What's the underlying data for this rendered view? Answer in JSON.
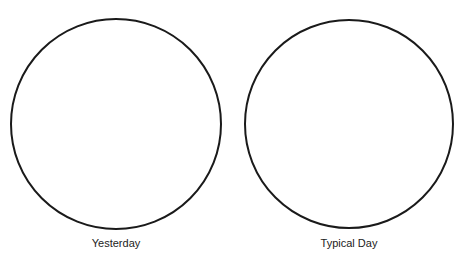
{
  "diagram": {
    "circles": [
      {
        "label": "Yesterday",
        "cx": 116,
        "cy": 124,
        "r": 105
      },
      {
        "label": "Typical Day",
        "cx": 349,
        "cy": 124,
        "r": 104
      }
    ],
    "stroke_color": "#1a1a1a"
  }
}
